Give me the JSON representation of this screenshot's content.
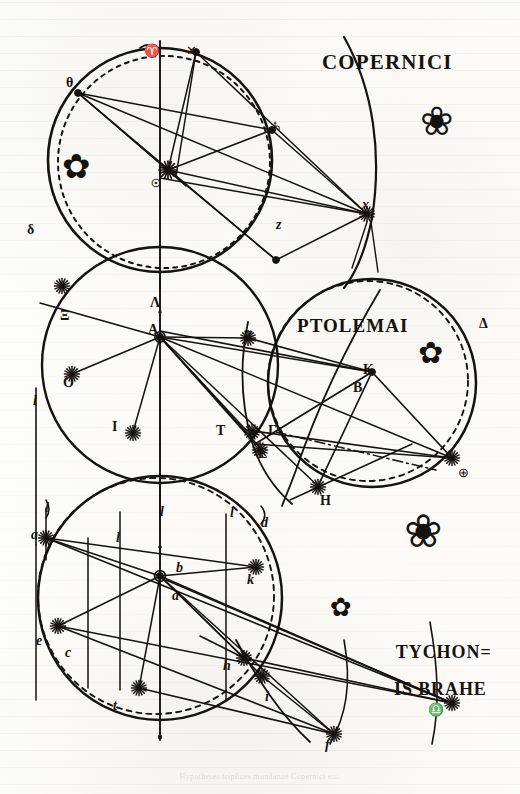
{
  "plate": {
    "kind": "engraved-plate",
    "width": 520,
    "height": 794,
    "paper_color": "#fcfcfa",
    "ink_color": "#151210",
    "caption": "Hypotheses triplices mundanae Copernici etc."
  },
  "headings": {
    "copernici": "COPERNICI",
    "ptolemai": "PTOLEMAI",
    "tycho_line1": "TYCHON=",
    "tycho_line2": "IS BRAHE"
  },
  "diagrams": [
    {
      "name": "copernican-system",
      "title": "COPERNICI",
      "center_symbol": "sun-starburst",
      "labels": [
        {
          "text": "θ",
          "x": 66,
          "y": 76,
          "style": "greek"
        },
        {
          "text": "♈",
          "x": 144,
          "y": 44,
          "style": "sym"
        },
        {
          "text": "✕",
          "x": 186,
          "y": 44,
          "style": "sym"
        },
        {
          "text": "δ",
          "x": 27,
          "y": 223,
          "style": "greek"
        },
        {
          "text": "♄",
          "x": 271,
          "y": 120,
          "style": "sym"
        },
        {
          "text": "z",
          "x": 276,
          "y": 218,
          "style": "lower"
        },
        {
          "text": "x",
          "x": 362,
          "y": 198,
          "style": "lower"
        },
        {
          "text": "☉",
          "x": 151,
          "y": 178,
          "style": "tiny"
        }
      ]
    },
    {
      "name": "ptolemaic-system",
      "title": "PTOLEMAI",
      "center_symbol": "earth-point-A",
      "labels": [
        {
          "text": "Λ",
          "x": 150,
          "y": 296,
          "style": "greek"
        },
        {
          "text": "A",
          "x": 148,
          "y": 323,
          "style": "greek"
        },
        {
          "text": "Ξ",
          "x": 60,
          "y": 309,
          "style": "greek"
        },
        {
          "text": "O",
          "x": 63,
          "y": 376,
          "style": "greek"
        },
        {
          "text": "I",
          "x": 112,
          "y": 420,
          "style": "greek"
        },
        {
          "text": "Z",
          "x": 244,
          "y": 330,
          "style": "greek"
        },
        {
          "text": "K",
          "x": 363,
          "y": 363,
          "style": "greek"
        },
        {
          "text": "B",
          "x": 353,
          "y": 381,
          "style": "greek"
        },
        {
          "text": "T",
          "x": 216,
          "y": 424,
          "style": "greek"
        },
        {
          "text": "Γ",
          "x": 268,
          "y": 424,
          "style": "greek"
        },
        {
          "text": "E",
          "x": 258,
          "y": 447,
          "style": "greek"
        },
        {
          "text": "H",
          "x": 320,
          "y": 494,
          "style": "greek"
        },
        {
          "text": "Δ",
          "x": 479,
          "y": 317,
          "style": "greek"
        },
        {
          "text": "⊕",
          "x": 458,
          "y": 466,
          "style": "sym"
        },
        {
          "text": "l",
          "x": 33,
          "y": 394,
          "style": "lower"
        }
      ]
    },
    {
      "name": "tychonic-system",
      "title": "TYCHONIS BRAHE",
      "center_symbol": "earth-point-b",
      "labels": [
        {
          "text": "a",
          "x": 31,
          "y": 528,
          "style": "lower"
        },
        {
          "text": "b",
          "x": 176,
          "y": 561,
          "style": "lower"
        },
        {
          "text": "a",
          "x": 172,
          "y": 589,
          "style": "lower"
        },
        {
          "text": "e",
          "x": 36,
          "y": 634,
          "style": "lower"
        },
        {
          "text": "c",
          "x": 65,
          "y": 646,
          "style": "lower"
        },
        {
          "text": "t",
          "x": 113,
          "y": 699,
          "style": "lower"
        },
        {
          "text": "k",
          "x": 247,
          "y": 573,
          "style": "lower"
        },
        {
          "text": "d",
          "x": 261,
          "y": 516,
          "style": "lower"
        },
        {
          "text": "h",
          "x": 223,
          "y": 659,
          "style": "lower"
        },
        {
          "text": "i",
          "x": 265,
          "y": 690,
          "style": "lower"
        },
        {
          "text": "f",
          "x": 325,
          "y": 738,
          "style": "lower"
        },
        {
          "text": "l",
          "x": 116,
          "y": 531,
          "style": "lower"
        },
        {
          "text": "l",
          "x": 160,
          "y": 505,
          "style": "lower"
        },
        {
          "text": "l",
          "x": 230,
          "y": 506,
          "style": "lower"
        },
        {
          "text": "l",
          "x": 45,
          "y": 501,
          "style": "lower"
        },
        {
          "text": "♎",
          "x": 428,
          "y": 703,
          "style": "sym"
        }
      ]
    }
  ],
  "ornaments": [
    {
      "name": "flower-fleuron-copernicus",
      "x": 62,
      "y": 152,
      "scale": 1.0
    },
    {
      "name": "crown-fleuron-right",
      "x": 425,
      "y": 110,
      "scale": 1.15
    },
    {
      "name": "flower-fleuron-ptolemy",
      "x": 420,
      "y": 345,
      "scale": 0.95
    },
    {
      "name": "small-flower-tycho",
      "x": 330,
      "y": 598,
      "scale": 0.8
    },
    {
      "name": "grand-fleuron-tycho",
      "x": 412,
      "y": 520,
      "scale": 1.25
    }
  ]
}
